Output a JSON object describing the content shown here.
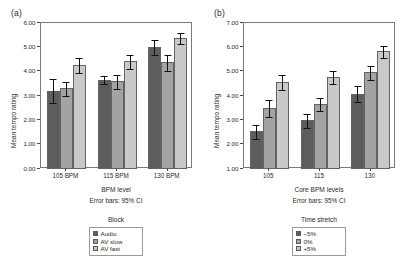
{
  "figure": {
    "panels": [
      {
        "tag": "(a)",
        "ylabel": "Mean tempo rating",
        "xlabel": "BPM level",
        "error_note": "Error bars: 95% CI",
        "legend_title": "Block"
      },
      {
        "tag": "(b)",
        "ylabel": "Mean tempo rating",
        "xlabel": "Core BPM levels",
        "error_note": "Error bars: 95% CI",
        "legend_title": "Time stretch"
      }
    ]
  },
  "chart_data": [
    {
      "type": "bar",
      "title": "(a)",
      "xlabel": "BPM level",
      "ylabel": "Mean tempo rating",
      "categories": [
        "105 BPM",
        "115 BPM",
        "130 BPM"
      ],
      "ylim": [
        0.0,
        6.0
      ],
      "yticks": [
        "0.00",
        "1.00",
        "2.00",
        "3.00",
        "4.00",
        "5.00",
        "6.00"
      ],
      "grid": false,
      "legend_title": "Block",
      "legend_position": "below",
      "error_note": "Error bars: 95% CI",
      "series": [
        {
          "name": "Audio",
          "color": "#5d5d5d",
          "values": [
            3.22,
            3.66,
            5.01
          ],
          "err_low": [
            0.5,
            0.18,
            0.31
          ],
          "err_high": [
            0.52,
            0.19,
            0.32
          ]
        },
        {
          "name": "AV slow",
          "color": "#a3a3a3",
          "values": [
            3.31,
            3.61,
            4.39
          ],
          "err_low": [
            0.3,
            0.31,
            0.35
          ],
          "err_high": [
            0.3,
            0.31,
            0.35
          ]
        },
        {
          "name": "AV fast",
          "color": "#c9c9c9",
          "values": [
            4.27,
            4.42,
            5.38
          ],
          "err_low": [
            0.32,
            0.3,
            0.26
          ],
          "err_high": [
            0.32,
            0.3,
            0.26
          ]
        }
      ]
    },
    {
      "type": "bar",
      "title": "(b)",
      "xlabel": "Core BPM levels",
      "ylabel": "Mean tempo rating",
      "categories": [
        "105",
        "115",
        "130"
      ],
      "ylim": [
        1.0,
        7.0
      ],
      "yticks": [
        "1.00",
        "2.00",
        "3.00",
        "4.00",
        "5.00",
        "6.00",
        "7.00"
      ],
      "grid": false,
      "legend_title": "Time stretch",
      "legend_position": "below",
      "error_note": "Error bars: 95% CI",
      "series": [
        {
          "name": "–5%",
          "color": "#5d5d5d",
          "values": [
            2.55,
            3.0,
            4.1
          ],
          "err_low": [
            0.3,
            0.3,
            0.35
          ],
          "err_high": [
            0.3,
            0.3,
            0.35
          ]
        },
        {
          "name": "0%",
          "color": "#a3a3a3",
          "values": [
            3.5,
            3.66,
            4.97
          ],
          "err_low": [
            0.37,
            0.28,
            0.3
          ],
          "err_high": [
            0.37,
            0.28,
            0.3
          ]
        },
        {
          "name": "+5%",
          "color": "#c9c9c9",
          "values": [
            4.57,
            4.78,
            5.83
          ],
          "err_low": [
            0.33,
            0.28,
            0.25
          ],
          "err_high": [
            0.33,
            0.28,
            0.25
          ]
        }
      ]
    }
  ]
}
